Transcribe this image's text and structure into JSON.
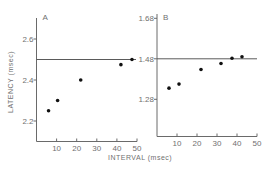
{
  "chart_data": [
    {
      "type": "scatter",
      "title": "A",
      "xlabel": "INTERVAL (msec)",
      "ylabel": "LATENCY (msec)",
      "xlim": [
        0,
        50
      ],
      "ylim": [
        2.1,
        2.68
      ],
      "xticks": [
        10,
        20,
        30,
        40,
        50
      ],
      "xtick_labels": [
        "10",
        "20",
        "30",
        "40",
        "50"
      ],
      "yticks": [
        2.2,
        2.4,
        2.6
      ],
      "ytick_labels": [
        "2.2",
        "2.4",
        "2.6"
      ],
      "reference_line_y": 2.5,
      "grid": false,
      "series": [
        {
          "name": "A",
          "x": [
            6,
            10.5,
            22,
            42,
            47.5
          ],
          "y": [
            2.25,
            2.3,
            2.4,
            2.475,
            2.5
          ]
        }
      ]
    },
    {
      "type": "scatter",
      "title": "B",
      "xlabel": "INTERVAL (msec)",
      "ylabel": "",
      "xlim": [
        0,
        50
      ],
      "ylim": [
        1.09,
        1.68
      ],
      "xticks": [
        10,
        20,
        30,
        40,
        50
      ],
      "xtick_labels": [
        "10",
        "20",
        "30",
        "40",
        "50"
      ],
      "yticks": [
        1.28,
        1.48,
        1.68
      ],
      "ytick_labels": [
        "1.28",
        "1.48",
        "1.68"
      ],
      "reference_line_y": 1.48,
      "grid": false,
      "series": [
        {
          "name": "B",
          "x": [
            6,
            11,
            22,
            32,
            37.5,
            42.5
          ],
          "y": [
            1.335,
            1.355,
            1.427,
            1.457,
            1.483,
            1.49
          ]
        }
      ]
    }
  ],
  "shared_xlabel": "INTERVAL (msec)",
  "shared_ylabel": "LATENCY (msec)"
}
